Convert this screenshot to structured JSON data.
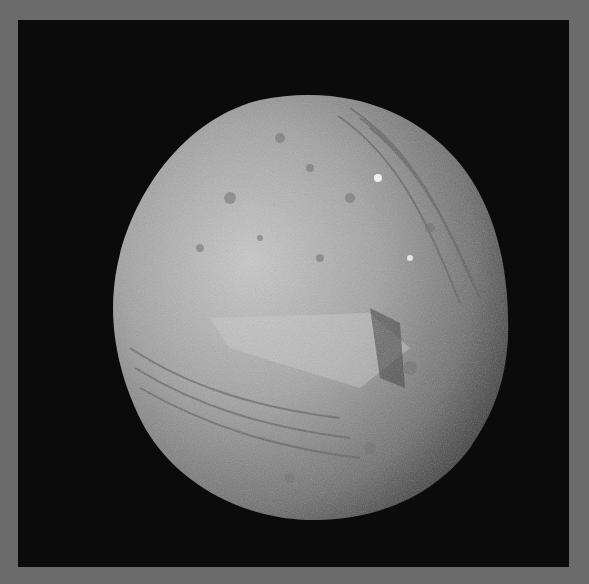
{
  "image": {
    "subject": "Miranda (moon of Uranus)",
    "description": "Grayscale spacecraft image of a cratered, grooved icy moon on black space background with gray border",
    "colors": {
      "border": "#6b6b6b",
      "background": "#0b0b0b",
      "surface_light": "#d8d8d8",
      "surface_mid": "#9a9a9a",
      "surface_dark": "#4a4a4a"
    }
  }
}
